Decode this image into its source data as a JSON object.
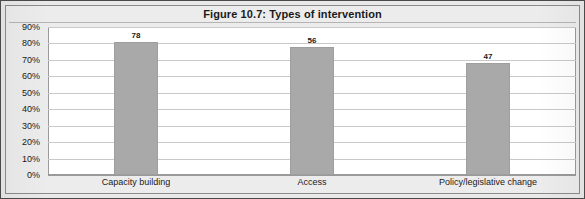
{
  "figure": {
    "title": "Figure 10.7: Types of intervention"
  },
  "colors": {
    "bar_fill": "#a9a9a9",
    "bar_border": "#9e9e9e",
    "plot_background": "#ffffff",
    "gridline": "#c9c9c9",
    "frame": "#4a4a4a",
    "page_background": "#e9e9e9",
    "text": "#1a1a1a"
  },
  "chart_data": {
    "type": "bar",
    "title": "Figure 10.7: Types of intervention",
    "xlabel": "",
    "ylabel": "",
    "categories": [
      "Capacity building",
      "Access",
      "Policy/legislative change"
    ],
    "values": [
      81,
      78,
      68
    ],
    "data_labels": [
      "78",
      "56",
      "47"
    ],
    "ylim": [
      0,
      90
    ],
    "yticks": [
      0,
      10,
      20,
      30,
      40,
      50,
      60,
      70,
      80,
      90
    ],
    "ytick_labels": [
      "0%",
      "10%",
      "20%",
      "30%",
      "40%",
      "50%",
      "60%",
      "70%",
      "80%",
      "90%"
    ],
    "grid": true,
    "legend": false,
    "legend_position": "none",
    "series": [
      {
        "name": "Types of intervention",
        "values": [
          81,
          78,
          68
        ],
        "labels": [
          "78",
          "56",
          "47"
        ]
      }
    ]
  }
}
